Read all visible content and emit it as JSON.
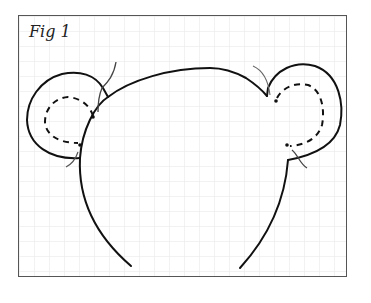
{
  "figure": {
    "label": "Fig 1",
    "grid": {
      "cell_px": 15,
      "color": "#e3e3e3"
    },
    "colors": {
      "ink": "#111111",
      "frame": "#555555",
      "thread": "#666666"
    }
  }
}
